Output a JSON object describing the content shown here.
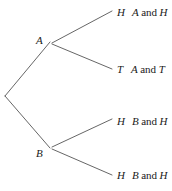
{
  "diagram": {
    "type": "probability-tree",
    "title": "",
    "background_color": "#ffffff",
    "line_color": "#555555",
    "text_color": "#1a1a1a",
    "root": {
      "label": "",
      "x": 5,
      "y": 96
    },
    "nodes": [
      {
        "id": "A",
        "label": "A",
        "x": 50,
        "y": 42
      },
      {
        "id": "B",
        "label": "B",
        "x": 50,
        "y": 148
      }
    ],
    "leaves": [
      {
        "id": "A-H",
        "parent": "A",
        "flip": "H",
        "outcome_first": "A",
        "outcome_conjunction": "and",
        "outcome_second": "H",
        "outcome_full": "A and H",
        "x": 112,
        "y": 13
      },
      {
        "id": "A-T",
        "parent": "A",
        "flip": "T",
        "outcome_first": "A",
        "outcome_conjunction": "and",
        "outcome_second": "T",
        "outcome_full": "A and T",
        "x": 112,
        "y": 70
      },
      {
        "id": "B-H-1",
        "parent": "B",
        "flip": "H",
        "outcome_first": "B",
        "outcome_conjunction": "and",
        "outcome_second": "H",
        "outcome_full": "B and H",
        "x": 112,
        "y": 122
      },
      {
        "id": "B-H-2",
        "parent": "B",
        "flip": "H",
        "outcome_first": "B",
        "outcome_conjunction": "and",
        "outcome_second": "H",
        "outcome_full": "B and H",
        "x": 112,
        "y": 176
      }
    ],
    "edges": [
      {
        "id": "root-to-A",
        "from_x": 5,
        "from_y": 96,
        "to_x": 50,
        "to_y": 42
      },
      {
        "id": "root-to-B",
        "from_x": 5,
        "from_y": 96,
        "to_x": 50,
        "to_y": 148
      },
      {
        "id": "A-to-H",
        "from_x": 52,
        "from_y": 43,
        "to_x": 112,
        "to_y": 11
      },
      {
        "id": "A-to-T",
        "from_x": 52,
        "from_y": 44,
        "to_x": 112,
        "to_y": 69
      },
      {
        "id": "B-to-H1",
        "from_x": 52,
        "from_y": 147,
        "to_x": 112,
        "to_y": 119
      },
      {
        "id": "B-to-H2",
        "from_x": 52,
        "from_y": 149,
        "to_x": 112,
        "to_y": 175
      }
    ]
  }
}
